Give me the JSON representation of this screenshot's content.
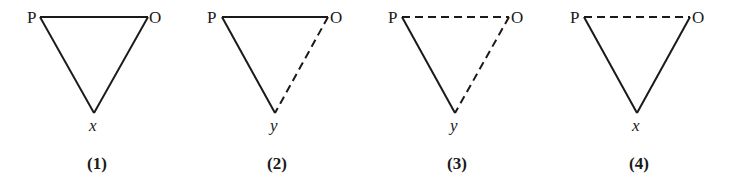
{
  "diagram": {
    "type": "triangle-diagrams",
    "stroke_color": "#1a1a1a",
    "background": "#ffffff",
    "figures": [
      {
        "id": "1",
        "caption": "(1)",
        "vertices": {
          "left": {
            "label": "P",
            "x": 40,
            "y": 17
          },
          "right": {
            "label": "O",
            "x": 148,
            "y": 17
          },
          "bottom": {
            "label": "x",
            "x": 94,
            "y": 113
          }
        },
        "edges": {
          "P-O": "solid",
          "P-bottom": "solid",
          "O-bottom": "solid"
        }
      },
      {
        "id": "2",
        "caption": "(2)",
        "vertices": {
          "left": {
            "label": "P",
            "x": 222,
            "y": 17
          },
          "right": {
            "label": "O",
            "x": 328,
            "y": 17
          },
          "bottom": {
            "label": "y",
            "x": 275,
            "y": 113
          }
        },
        "edges": {
          "P-O": "solid",
          "P-bottom": "solid",
          "O-bottom": "dashed"
        }
      },
      {
        "id": "3",
        "caption": "(3)",
        "vertices": {
          "left": {
            "label": "P",
            "x": 402,
            "y": 17
          },
          "right": {
            "label": "O",
            "x": 509,
            "y": 17
          },
          "bottom": {
            "label": "y",
            "x": 455,
            "y": 113
          }
        },
        "edges": {
          "P-O": "dashed",
          "P-bottom": "solid",
          "O-bottom": "dashed"
        }
      },
      {
        "id": "4",
        "caption": "(4)",
        "vertices": {
          "left": {
            "label": "P",
            "x": 584,
            "y": 17
          },
          "right": {
            "label": "O",
            "x": 690,
            "y": 17
          },
          "bottom": {
            "label": "x",
            "x": 637,
            "y": 113
          }
        },
        "edges": {
          "P-O": "dashed",
          "P-bottom": "solid",
          "O-bottom": "solid"
        }
      }
    ]
  }
}
